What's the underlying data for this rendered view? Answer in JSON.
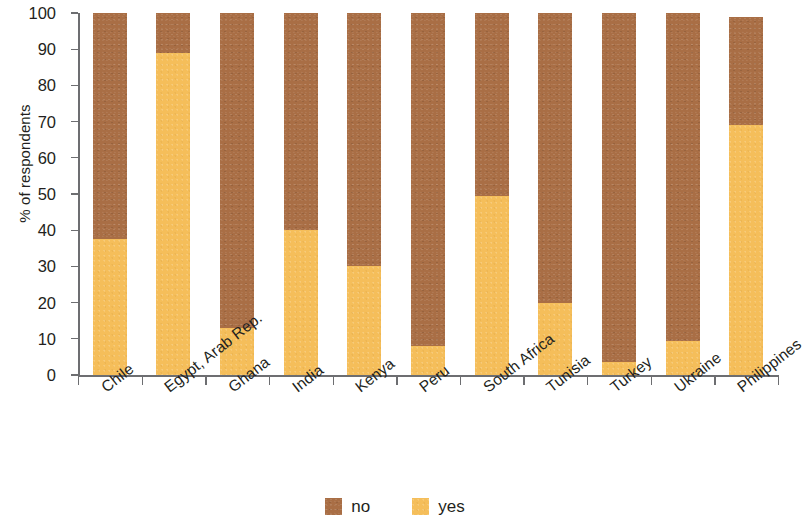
{
  "chart_data": {
    "type": "bar",
    "subtype": "stacked-bar-100",
    "title": "",
    "xlabel": "",
    "ylabel": "% of respondents",
    "ylim": [
      0,
      100
    ],
    "yticks": [
      0,
      10,
      20,
      30,
      40,
      50,
      60,
      70,
      80,
      90,
      100
    ],
    "ytick_labels": [
      "0",
      "10",
      "20",
      "30",
      "40",
      "50",
      "60",
      "70",
      "80",
      "90",
      "100"
    ],
    "grid": false,
    "legend_position": "bottom-center",
    "categories": [
      "Chile",
      "Egypt, Arab Rep.",
      "Ghana",
      "India",
      "Kenya",
      "Peru",
      "South Africa",
      "Tunisia",
      "Turkey",
      "Ukraine",
      "Philippines"
    ],
    "series": [
      {
        "name": "no",
        "color": "#a96e45",
        "values": [
          62.5,
          11,
          87,
          60,
          70,
          92,
          50.5,
          80,
          96.5,
          90.5,
          30
        ]
      },
      {
        "name": "yes",
        "color": "#f5be5a",
        "values": [
          37.5,
          89,
          13,
          40,
          30,
          8,
          49.5,
          20,
          3.5,
          9.5,
          69
        ]
      }
    ],
    "stack_order": [
      "yes",
      "no"
    ],
    "totals": [
      100,
      100,
      100,
      100,
      100,
      100,
      100,
      100,
      100,
      100,
      99
    ]
  },
  "legend": {
    "items": [
      {
        "label": "no",
        "color": "#a96e45",
        "swatch_name": "legend-swatch-no"
      },
      {
        "label": "yes",
        "color": "#f5be5a",
        "swatch_name": "legend-swatch-yes"
      }
    ]
  },
  "colors": {
    "no": "#a96e45",
    "yes": "#f5be5a",
    "axis": "#6d6e71",
    "text": "#231f20",
    "background": "#ffffff"
  }
}
